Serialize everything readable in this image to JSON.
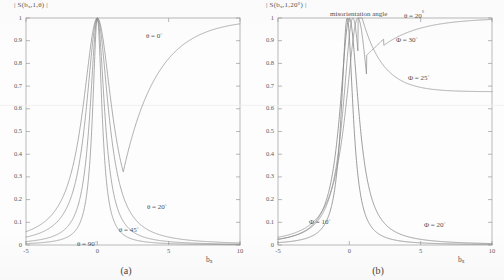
{
  "figure": {
    "panels": [
      {
        "caption": "(a)",
        "ylabel_prefix": "| S(b",
        "ylabel_sub": "x",
        "ylabel_suffix": ",1,θ) |",
        "xlabel_main": "b",
        "xlabel_sub": "x",
        "annotations": [
          {
            "text": "θ = 0",
            "deg": "°"
          },
          {
            "text": "θ = 20",
            "deg": "°"
          },
          {
            "text": "θ = 45",
            "deg": "°"
          },
          {
            "text": "θ = 90",
            "deg": "°"
          }
        ]
      },
      {
        "caption": "(b)",
        "ylabel_prefix": "| S(b",
        "ylabel_sub": "x",
        "ylabel_suffix": ",1,20°) |",
        "xlabel_main": "b",
        "xlabel_sub": "x",
        "header_note": "misorientation angle",
        "header_theta": "θ = 20",
        "header_theta_deg": "°",
        "annotations": [
          {
            "text": "Φ = 30",
            "deg": "°"
          },
          {
            "text": "Φ = 25",
            "deg": "°"
          },
          {
            "text": "Φ = 20",
            "deg": "°"
          },
          {
            "text": "Φ = 10",
            "deg": "°"
          }
        ]
      }
    ],
    "ytick_labels": [
      "1",
      "0.9",
      "0.8",
      "0.7",
      "0.6",
      "0.5",
      "0.4",
      "0.3",
      "0.2",
      "0.1",
      "0"
    ],
    "xtick_labels": [
      "-5",
      "0",
      "5",
      "10"
    ],
    "line_color": "#8a8a8a",
    "axis_color": "#9a9a9a"
  },
  "chart_data": [
    {
      "type": "line",
      "title": "",
      "xlabel": "b_x",
      "ylabel": "| S(b_x,1,θ) |",
      "xlim": [
        -5,
        10
      ],
      "ylim": [
        0,
        1
      ],
      "xticks": [
        -5,
        0,
        5,
        10
      ],
      "yticks": [
        0,
        0.1,
        0.2,
        0.3,
        0.4,
        0.5,
        0.6,
        0.7,
        0.8,
        0.9,
        1
      ],
      "grid": false,
      "legend": "inline-annotations",
      "panel": "(a)",
      "series": [
        {
          "name": "θ = 0°",
          "peak_x": 0.0,
          "peak_y": 1.0,
          "half_width": 5.5,
          "note": "broadest; decays slowly then rises back toward 1 at b_x = 10",
          "x": [
            -5,
            -4,
            -3,
            -2,
            -1,
            0,
            1,
            2,
            3,
            4,
            5,
            6,
            7,
            8,
            9,
            10
          ],
          "y": [
            0.08,
            0.1,
            0.14,
            0.24,
            0.58,
            1.0,
            0.6,
            0.33,
            0.4,
            0.55,
            0.7,
            0.81,
            0.88,
            0.93,
            0.97,
            1.0
          ]
        },
        {
          "name": "θ = 20°",
          "peak_x": 0.0,
          "peak_y": 1.0,
          "half_width": 0.95,
          "note": "moderate width; long right tail decaying to ~0.03",
          "x": [
            -5,
            -4,
            -3,
            -2,
            -1,
            0,
            1,
            2,
            3,
            4,
            5,
            6,
            7,
            8,
            9,
            10
          ],
          "y": [
            0.04,
            0.05,
            0.08,
            0.17,
            0.55,
            1.0,
            0.55,
            0.25,
            0.16,
            0.12,
            0.09,
            0.07,
            0.06,
            0.05,
            0.04,
            0.04
          ]
        },
        {
          "name": "θ = 45°",
          "peak_x": 0.0,
          "peak_y": 1.0,
          "half_width": 0.62,
          "note": "narrower; tail falls to ~0.02",
          "x": [
            -5,
            -4,
            -3,
            -2,
            -1,
            0,
            1,
            2,
            3,
            4,
            5,
            6,
            7,
            8,
            9,
            10
          ],
          "y": [
            0.02,
            0.03,
            0.04,
            0.1,
            0.42,
            1.0,
            0.42,
            0.15,
            0.08,
            0.06,
            0.04,
            0.03,
            0.03,
            0.02,
            0.02,
            0.02
          ]
        },
        {
          "name": "θ = 90°",
          "peak_x": 0.0,
          "peak_y": 1.0,
          "half_width": 0.4,
          "note": "narrowest peak",
          "x": [
            -5,
            -4,
            -3,
            -2,
            -1,
            0,
            1,
            2,
            3,
            4,
            5,
            6,
            7,
            8,
            9,
            10
          ],
          "y": [
            0.01,
            0.01,
            0.02,
            0.06,
            0.3,
            1.0,
            0.3,
            0.09,
            0.05,
            0.03,
            0.02,
            0.02,
            0.01,
            0.01,
            0.01,
            0.01
          ]
        }
      ]
    },
    {
      "type": "line",
      "title": "misorientation angle θ = 20°",
      "xlabel": "b_x",
      "ylabel": "| S(b_x,1,20°) |",
      "xlim": [
        -5,
        10
      ],
      "ylim": [
        0,
        1
      ],
      "xticks": [
        -5,
        0,
        5,
        10
      ],
      "yticks": [
        0,
        0.1,
        0.2,
        0.3,
        0.4,
        0.5,
        0.6,
        0.7,
        0.8,
        0.9,
        1
      ],
      "grid": false,
      "legend": "inline-annotations",
      "panel": "(b)",
      "series": [
        {
          "name": "Φ = 30°",
          "peak_x": 0.6,
          "peak_y": 1.0,
          "note": "rises from dip near b_x=1.5 back up to ~1.0 at b_x=10",
          "x": [
            -5,
            -4,
            -3,
            -2,
            -1,
            0,
            1,
            2,
            3,
            4,
            5,
            6,
            7,
            8,
            9,
            10
          ],
          "y": [
            0.05,
            0.07,
            0.1,
            0.2,
            0.52,
            0.97,
            0.93,
            0.84,
            0.89,
            0.92,
            0.94,
            0.96,
            0.97,
            0.98,
            0.99,
            1.0
          ]
        },
        {
          "name": "Φ = 25°",
          "peak_x": 0.3,
          "peak_y": 1.0,
          "note": "settles to a plateau near 0.68",
          "x": [
            -5,
            -4,
            -3,
            -2,
            -1,
            0,
            1,
            2,
            3,
            4,
            5,
            6,
            7,
            8,
            9,
            10
          ],
          "y": [
            0.04,
            0.06,
            0.09,
            0.18,
            0.55,
            1.0,
            0.97,
            0.88,
            0.8,
            0.75,
            0.72,
            0.7,
            0.69,
            0.68,
            0.68,
            0.68
          ]
        },
        {
          "name": "Φ = 20°",
          "peak_x": 0.0,
          "peak_y": 1.0,
          "note": "narrow peak, tail decays to ~0.05 at right edge",
          "x": [
            -5,
            -4,
            -3,
            -2,
            -1,
            0,
            1,
            2,
            3,
            4,
            5,
            6,
            7,
            8,
            9,
            10
          ],
          "y": [
            0.03,
            0.04,
            0.06,
            0.14,
            0.5,
            1.0,
            0.5,
            0.22,
            0.14,
            0.1,
            0.08,
            0.07,
            0.06,
            0.05,
            0.05,
            0.05
          ]
        },
        {
          "name": "Φ = 10°",
          "peak_x": -0.15,
          "peak_y": 1.0,
          "note": "narrowest peak, steep sides",
          "x": [
            -5,
            -4,
            -3,
            -2,
            -1,
            0,
            1,
            2,
            3,
            4,
            5,
            6,
            7,
            8,
            9,
            10
          ],
          "y": [
            0.02,
            0.02,
            0.04,
            0.09,
            0.38,
            1.0,
            0.36,
            0.13,
            0.07,
            0.05,
            0.04,
            0.03,
            0.03,
            0.02,
            0.02,
            0.02
          ]
        }
      ]
    }
  ]
}
